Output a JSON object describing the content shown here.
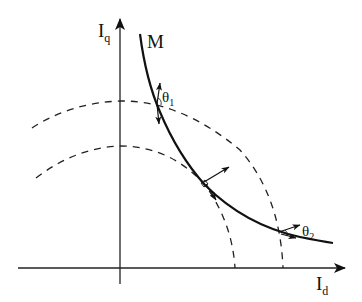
{
  "diagram": {
    "type": "current-locus diagram (Id-Iq plane)",
    "axes": {
      "x_label_main": "I",
      "x_label_sub": "d",
      "y_label_main": "I",
      "y_label_sub": "q"
    },
    "curve": {
      "label": "M",
      "style": "solid thick"
    },
    "dashed_arcs": [
      {
        "name": "outer-circle",
        "style": "dashed"
      },
      {
        "name": "inner-circle",
        "style": "dashed"
      }
    ],
    "angles": [
      {
        "label_main": "θ",
        "label_sub": "1"
      },
      {
        "label_main": "θ",
        "label_sub": "2"
      }
    ],
    "colors": {
      "stroke": "#111111",
      "background": "#ffffff"
    }
  }
}
